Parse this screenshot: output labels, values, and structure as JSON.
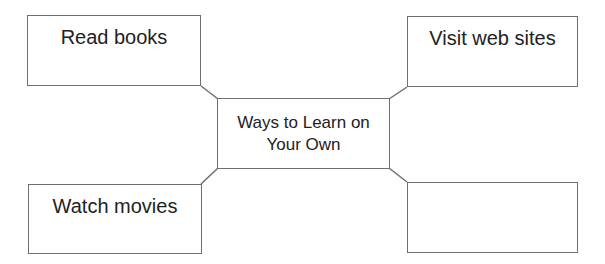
{
  "diagram": {
    "type": "concept-map",
    "center": {
      "label": "Ways to Learn on Your Own"
    },
    "nodes": [
      {
        "position": "top-left",
        "label": "Read books"
      },
      {
        "position": "top-right",
        "label": "Visit web sites"
      },
      {
        "position": "bottom-left",
        "label": "Watch movies"
      },
      {
        "position": "bottom-right",
        "label": ""
      }
    ],
    "colors": {
      "border": "#6f6f6f",
      "text": "#222222",
      "background": "#ffffff"
    }
  }
}
